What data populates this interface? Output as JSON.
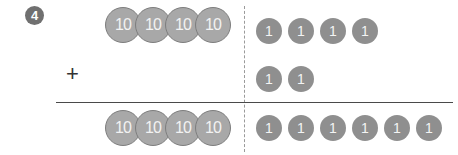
{
  "problem_number": "4",
  "operator": "+",
  "rows": [
    {
      "tens": [
        "10",
        "10",
        "10",
        "10"
      ],
      "ones": [
        "1",
        "1",
        "1",
        "1"
      ]
    },
    {
      "tens": [],
      "ones": [
        "1",
        "1"
      ]
    },
    {
      "tens": [
        "10",
        "10",
        "10",
        "10"
      ],
      "ones": [
        "1",
        "1",
        "1",
        "1",
        "1",
        "1"
      ]
    }
  ],
  "colors": {
    "badge": "#707070",
    "coin10_fill": "#a8a8a8",
    "coin1_fill": "#8f8f8f",
    "rule": "#4a4a4a"
  }
}
